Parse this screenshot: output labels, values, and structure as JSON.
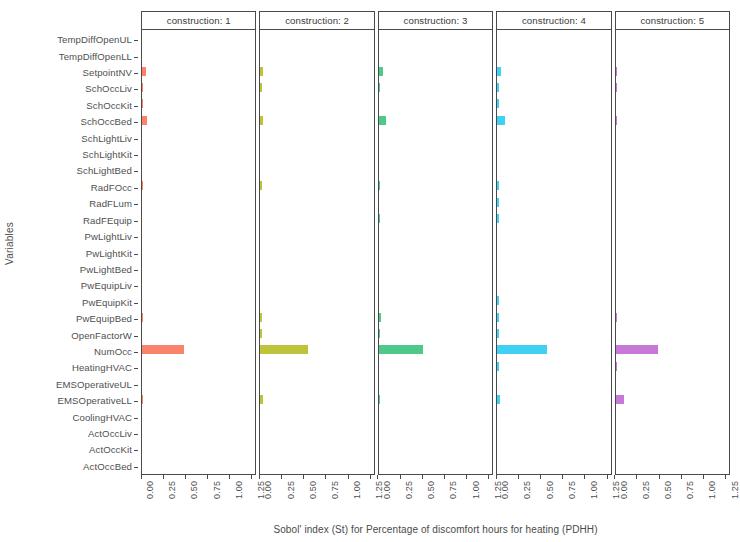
{
  "chart_data": {
    "type": "bar",
    "title": "",
    "xlabel": "Sobol' index (St) for Percentage of discomfort hours for heating (PDHH)",
    "ylabel": "Variables",
    "orientation": "horizontal",
    "facet_variable": "construction",
    "xlim": [
      0,
      1.3
    ],
    "xticks": [
      0.0,
      0.25,
      0.5,
      0.75,
      1.0,
      1.25
    ],
    "xtick_labels": [
      "0.00",
      "0.25",
      "0.50",
      "0.75",
      "1.00",
      "1.25"
    ],
    "grid": false,
    "legend": "none",
    "categories": [
      "TempDiffOpenUL",
      "TempDiffOpenLL",
      "SetpointNV",
      "SchOccLiv",
      "SchOccKit",
      "SchOccBed",
      "SchLightLiv",
      "SchLightKit",
      "SchLightBed",
      "RadFOcc",
      "RadFLum",
      "RadFEquip",
      "PwLightLiv",
      "PwLightKit",
      "PwLightBed",
      "PwEquipLiv",
      "PwEquipKit",
      "PwEquipBed",
      "OpenFactorW",
      "NumOcc",
      "HeatingHVAC",
      "EMSOperativeUL",
      "EMSOperativeLL",
      "CoolingHVAC",
      "ActOccLiv",
      "ActOccKit",
      "ActOccBed"
    ],
    "panels": [
      {
        "label": "construction: 1",
        "facet_value": "1",
        "color": "#F9836B",
        "values": [
          0,
          0,
          0.047,
          0.012,
          0.008,
          0.062,
          0,
          0,
          0,
          0.012,
          0,
          0,
          0,
          0,
          0,
          0,
          0,
          0.013,
          0,
          0.48,
          0,
          0,
          0.014,
          0,
          0,
          0,
          0
        ]
      },
      {
        "label": "construction: 2",
        "facet_value": "2",
        "color": "#BFC33A",
        "values": [
          0,
          0,
          0.03,
          0.009,
          0,
          0.028,
          0,
          0,
          0,
          0.006,
          0,
          0,
          0,
          0,
          0,
          0,
          0,
          0.022,
          0.006,
          0.54,
          0,
          0,
          0.026,
          0,
          0,
          0,
          0
        ]
      },
      {
        "label": "construction: 3",
        "facet_value": "3",
        "color": "#4FC98A",
        "values": [
          0,
          0,
          0.045,
          0.01,
          0,
          0.085,
          0,
          0,
          0,
          0.018,
          0,
          0.007,
          0,
          0,
          0,
          0,
          0,
          0.021,
          0.008,
          0.51,
          0,
          0,
          0.016,
          0,
          0,
          0,
          0
        ]
      },
      {
        "label": "construction: 4",
        "facet_value": "4",
        "color": "#3FD0F2",
        "values": [
          0,
          0,
          0.046,
          0.01,
          0.006,
          0.09,
          0,
          0,
          0,
          0.026,
          0.008,
          0.006,
          0,
          0,
          0,
          0,
          0.01,
          0.022,
          0.01,
          0.57,
          0.01,
          0,
          0.03,
          0,
          0,
          0,
          0
        ]
      },
      {
        "label": "construction: 5",
        "facet_value": "5",
        "color": "#C778D6",
        "values": [
          0,
          0,
          0.007,
          0.006,
          0,
          0.008,
          0,
          0,
          0,
          0,
          0,
          0,
          0,
          0,
          0,
          0,
          0,
          0.015,
          0,
          0.49,
          0.01,
          0,
          0.095,
          0,
          0,
          0,
          0
        ]
      }
    ]
  },
  "axes": {
    "y_title": "Variables",
    "x_title": "Sobol' index (St) for Percentage of discomfort hours for heating (PDHH)"
  }
}
